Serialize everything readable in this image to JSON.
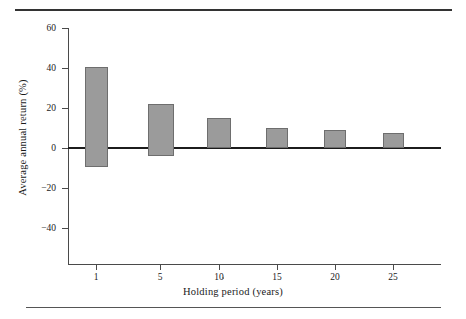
{
  "chart_data": {
    "type": "bar",
    "title": "",
    "xlabel": "Holding period (years)",
    "ylabel": "Average annual return (%)",
    "categories": [
      "1",
      "5",
      "10",
      "15",
      "20",
      "25"
    ],
    "series": [
      {
        "name": "Maximum average annual return",
        "values": [
          40.5,
          22.0,
          15.0,
          10.0,
          9.0,
          7.5
        ]
      },
      {
        "name": "Minimum average annual return",
        "values": [
          -9.5,
          -4.0,
          0,
          0,
          0,
          0
        ]
      }
    ],
    "bars": [
      {
        "category": "1",
        "high": 40.5,
        "low": -9.5
      },
      {
        "category": "5",
        "high": 22.0,
        "low": -4.0
      },
      {
        "category": "10",
        "high": 15.0,
        "low": 0
      },
      {
        "category": "15",
        "high": 10.0,
        "low": 0
      },
      {
        "category": "20",
        "high": 9.0,
        "low": 0
      },
      {
        "category": "25",
        "high": 7.5,
        "low": 0
      }
    ],
    "ylim": [
      -60,
      60
    ],
    "yticks": [
      60,
      40,
      20,
      0,
      -20,
      -40
    ],
    "ytick_labels": [
      "60",
      "40",
      "20",
      "0",
      "−20",
      "−40"
    ],
    "xticks": [
      1,
      5,
      10,
      15,
      20,
      25
    ],
    "xtick_labels": [
      "1",
      "5",
      "10",
      "15",
      "20",
      "25"
    ],
    "grid": false,
    "legend": "none",
    "bar_color": "#9b9b9b",
    "bar_edge_color": "#6e6e6e",
    "axis_color": "#4a4a4a",
    "zero_line_color": "#1c1c1c"
  },
  "figure": {
    "top_rule_color": "#333333",
    "bottom_rule_color": "#555555"
  }
}
